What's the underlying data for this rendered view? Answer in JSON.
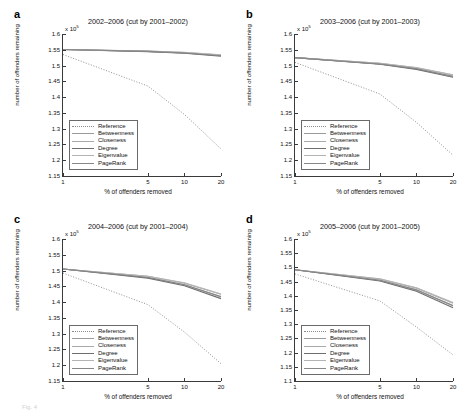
{
  "figure": {
    "caption_fragment": "Fig. 4",
    "axis": {
      "xlabel": "% of offenders removed",
      "ylabel": "number of offenders remaining",
      "exponent_label": "x 10",
      "exponent_power": "5",
      "xticks": [
        "1",
        "5",
        "10",
        "20"
      ],
      "xtick_values": [
        1,
        5,
        10,
        20
      ],
      "xscale": "log",
      "xlim": [
        1,
        20
      ]
    },
    "legend": {
      "entries": [
        {
          "label": "Reference",
          "color": "#8c8c8c",
          "style": "dotted"
        },
        {
          "label": "Betweenness",
          "color": "#9a9a9a",
          "style": "solid"
        },
        {
          "label": "Closeness",
          "color": "#a8a8a8",
          "style": "solid"
        },
        {
          "label": "Degree",
          "color": "#6e6e6e",
          "style": "solid"
        },
        {
          "label": "Eigenvalue",
          "color": "#b4b4b4",
          "style": "solid"
        },
        {
          "label": "PageRank",
          "color": "#878787",
          "style": "solid"
        }
      ]
    }
  },
  "chart_data": [
    {
      "type": "line",
      "panel": "a",
      "letter": "a",
      "title": "2002–2006 (cut by 2001–2002)",
      "xlabel": "% of offenders removed",
      "ylabel": "number of offenders remaining",
      "xscale": "log",
      "xlim": [
        1,
        20
      ],
      "ylim": [
        1.15,
        1.6
      ],
      "yticks": [
        "1.15",
        "1.2",
        "1.25",
        "1.3",
        "1.35",
        "1.4",
        "1.45",
        "1.5",
        "1.55",
        "1.6"
      ],
      "ytick_values": [
        1.15,
        1.2,
        1.25,
        1.3,
        1.35,
        1.4,
        1.45,
        1.5,
        1.55,
        1.6
      ],
      "y_units": "x 10^5",
      "x": [
        1,
        5,
        10,
        20
      ],
      "series": [
        {
          "name": "Reference",
          "values": [
            1.535,
            1.435,
            1.345,
            1.236
          ]
        },
        {
          "name": "Betweenness",
          "values": [
            1.551,
            1.545,
            1.54,
            1.532
          ]
        },
        {
          "name": "Closeness",
          "values": [
            1.551,
            1.546,
            1.541,
            1.533
          ]
        },
        {
          "name": "Degree",
          "values": [
            1.551,
            1.544,
            1.539,
            1.53
          ]
        },
        {
          "name": "Eigenvalue",
          "values": [
            1.551,
            1.546,
            1.542,
            1.534
          ]
        },
        {
          "name": "PageRank",
          "values": [
            1.551,
            1.545,
            1.54,
            1.531
          ]
        }
      ]
    },
    {
      "type": "line",
      "panel": "b",
      "letter": "b",
      "title": "2003–2006 (cut by 2001–2003)",
      "xlabel": "% of offenders removed",
      "ylabel": "number of offenders remaining",
      "xscale": "log",
      "xlim": [
        1,
        20
      ],
      "ylim": [
        1.15,
        1.6
      ],
      "yticks": [
        "1.15",
        "1.2",
        "1.25",
        "1.3",
        "1.35",
        "1.4",
        "1.45",
        "1.5",
        "1.55",
        "1.6"
      ],
      "ytick_values": [
        1.15,
        1.2,
        1.25,
        1.3,
        1.35,
        1.4,
        1.45,
        1.5,
        1.55,
        1.6
      ],
      "y_units": "x 10^5",
      "x": [
        1,
        5,
        10,
        20
      ],
      "series": [
        {
          "name": "Reference",
          "values": [
            1.51,
            1.41,
            1.32,
            1.216
          ]
        },
        {
          "name": "Betweenness",
          "values": [
            1.525,
            1.505,
            1.49,
            1.466
          ]
        },
        {
          "name": "Closeness",
          "values": [
            1.525,
            1.507,
            1.493,
            1.47
          ]
        },
        {
          "name": "Degree",
          "values": [
            1.525,
            1.504,
            1.488,
            1.463
          ]
        },
        {
          "name": "Eigenvalue",
          "values": [
            1.525,
            1.507,
            1.494,
            1.471
          ]
        },
        {
          "name": "PageRank",
          "values": [
            1.525,
            1.505,
            1.49,
            1.465
          ]
        }
      ]
    },
    {
      "type": "line",
      "panel": "c",
      "letter": "c",
      "title": "2004–2006 (cut by 2001–2004)",
      "xlabel": "% of offenders removed",
      "ylabel": "number of offenders remaining",
      "xscale": "log",
      "xlim": [
        1,
        20
      ],
      "ylim": [
        1.15,
        1.6
      ],
      "yticks": [
        "1.15",
        "1.2",
        "1.25",
        "1.3",
        "1.35",
        "1.4",
        "1.45",
        "1.5",
        "1.55",
        "1.6"
      ],
      "ytick_values": [
        1.15,
        1.2,
        1.25,
        1.3,
        1.35,
        1.4,
        1.45,
        1.5,
        1.55,
        1.6
      ],
      "y_units": "x 10^5",
      "x": [
        1,
        5,
        10,
        20
      ],
      "series": [
        {
          "name": "Reference",
          "values": [
            1.492,
            1.392,
            1.305,
            1.205
          ]
        },
        {
          "name": "Betweenness",
          "values": [
            1.505,
            1.478,
            1.455,
            1.416
          ]
        },
        {
          "name": "Closeness",
          "values": [
            1.505,
            1.482,
            1.46,
            1.425
          ]
        },
        {
          "name": "Degree",
          "values": [
            1.505,
            1.476,
            1.452,
            1.411
          ]
        },
        {
          "name": "Eigenvalue",
          "values": [
            1.505,
            1.482,
            1.461,
            1.426
          ]
        },
        {
          "name": "PageRank",
          "values": [
            1.505,
            1.478,
            1.455,
            1.418
          ]
        }
      ]
    },
    {
      "type": "line",
      "panel": "d",
      "letter": "d",
      "title": "2005–2006 (cut by 2001–2005)",
      "xlabel": "% of offenders removed",
      "ylabel": "number of offenders remaining",
      "xscale": "log",
      "xlim": [
        1,
        20
      ],
      "ylim": [
        1.1,
        1.6
      ],
      "yticks": [
        "1.1",
        "1.15",
        "1.2",
        "1.25",
        "1.3",
        "1.35",
        "1.4",
        "1.45",
        "1.5",
        "1.55",
        "1.6"
      ],
      "ytick_values": [
        1.1,
        1.15,
        1.2,
        1.25,
        1.3,
        1.35,
        1.4,
        1.45,
        1.5,
        1.55,
        1.6
      ],
      "y_units": "x 10^5",
      "x": [
        1,
        5,
        10,
        20
      ],
      "series": [
        {
          "name": "Reference",
          "values": [
            1.477,
            1.382,
            1.29,
            1.192
          ]
        },
        {
          "name": "Betweenness",
          "values": [
            1.492,
            1.455,
            1.42,
            1.364
          ]
        },
        {
          "name": "Closeness",
          "values": [
            1.492,
            1.459,
            1.427,
            1.374
          ]
        },
        {
          "name": "Degree",
          "values": [
            1.492,
            1.452,
            1.416,
            1.358
          ]
        },
        {
          "name": "Eigenvalue",
          "values": [
            1.492,
            1.46,
            1.428,
            1.376
          ]
        },
        {
          "name": "PageRank",
          "values": [
            1.492,
            1.455,
            1.421,
            1.366
          ]
        }
      ]
    }
  ]
}
